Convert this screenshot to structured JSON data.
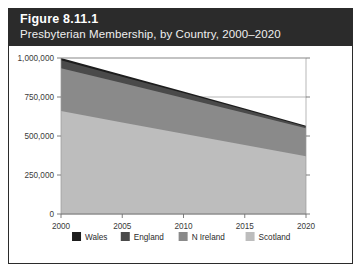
{
  "figure": {
    "number_label": "Figure 8.11.1",
    "subtitle": "Presbyterian Membership, by Country, 2000–2020",
    "header_bg": "#2b2b2b",
    "header_text_color": "#ffffff",
    "frame_border_color": "#2b2b2b",
    "background": "#ffffff"
  },
  "chart_data": {
    "type": "area",
    "stacked": true,
    "title": "Figure 8.11.1",
    "subtitle": "Presbyterian Membership, by Country, 2000–2020",
    "xlabel": "",
    "ylabel": "",
    "x": [
      2000,
      2005,
      2010,
      2015,
      2020
    ],
    "xlim": [
      2000,
      2020
    ],
    "ylim": [
      0,
      1000000
    ],
    "xtick_labels": [
      "2000",
      "2005",
      "2010",
      "2015",
      "2020"
    ],
    "ytick_values": [
      0,
      250000,
      500000,
      750000,
      1000000
    ],
    "ytick_labels": [
      "0",
      "250,000",
      "500,000",
      "750,000",
      "1,000,000"
    ],
    "grid": true,
    "grid_axis": "y",
    "legend_position": "bottom",
    "stack_order_bottom_to_top": [
      "Scotland",
      "N Ireland",
      "England",
      "Wales"
    ],
    "series": [
      {
        "name": "Wales",
        "color": "#1d1d1d",
        "values": [
          15000,
          12500,
          10000,
          7500,
          5000
        ]
      },
      {
        "name": "England",
        "color": "#4a4a4a",
        "values": [
          50000,
          41000,
          32000,
          21000,
          10000
        ]
      },
      {
        "name": "N Ireland",
        "color": "#8a8a8a",
        "values": [
          275000,
          252000,
          229000,
          205000,
          180000
        ]
      },
      {
        "name": "Scotland",
        "color": "#bdbdbd",
        "values": [
          660000,
          587000,
          514000,
          442000,
          370000
        ]
      }
    ],
    "totals": [
      1000000,
      892500,
      785000,
      675500,
      565000
    ]
  },
  "legend": {
    "items": [
      {
        "label": "Wales",
        "color": "#1d1d1d"
      },
      {
        "label": "England",
        "color": "#4a4a4a"
      },
      {
        "label": "N Ireland",
        "color": "#8a8a8a"
      },
      {
        "label": "Scotland",
        "color": "#bdbdbd"
      }
    ]
  },
  "axes": {
    "y_labels": [
      "1,000,000",
      "750,000",
      "500,000",
      "250,000",
      "0"
    ],
    "x_labels": [
      "2000",
      "2005",
      "2010",
      "2015",
      "2020"
    ]
  }
}
